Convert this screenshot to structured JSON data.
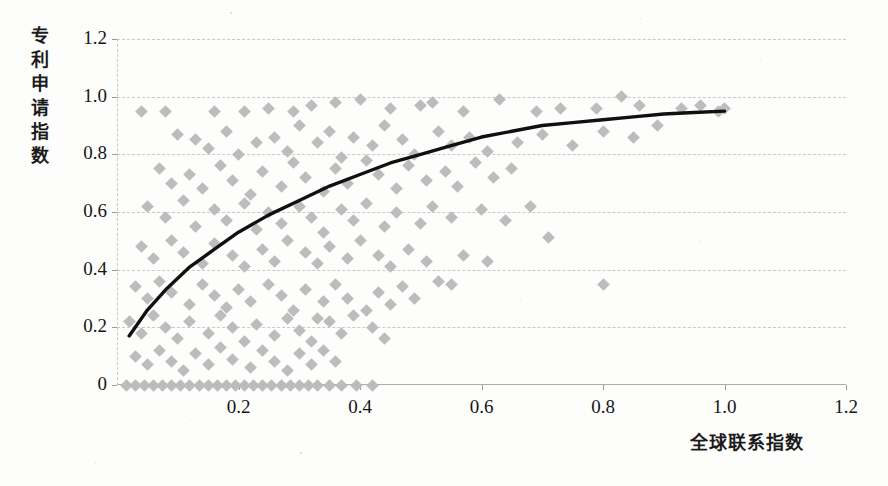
{
  "chart_data": {
    "type": "scatter",
    "title": "",
    "xlabel": "全球联系指数",
    "ylabel": "专利申请指数",
    "xlim": [
      0,
      1.2
    ],
    "ylim": [
      0,
      1.2
    ],
    "xticks": [
      "0.2",
      "0.4",
      "0.6",
      "0.8",
      "1.0",
      "1.2"
    ],
    "xtick_values": [
      0.2,
      0.4,
      0.6,
      0.8,
      1.0,
      1.2
    ],
    "yticks": [
      "0",
      "0.2",
      "0.4",
      "0.6",
      "0.8",
      "1.0",
      "1.2"
    ],
    "ytick_values": [
      0,
      0.2,
      0.4,
      0.6,
      0.8,
      1.0,
      1.2
    ],
    "grid": true,
    "legend": "none",
    "marker": "diamond",
    "marker_color": "#bcbcbc",
    "trendline_color": "#101010",
    "gridline_color": "#c9c9c9",
    "series": [
      {
        "name": "观测点",
        "type": "scatter",
        "points": [
          [
            0.04,
            0.95
          ],
          [
            0.08,
            0.95
          ],
          [
            0.16,
            0.95
          ],
          [
            0.21,
            0.95
          ],
          [
            0.25,
            0.96
          ],
          [
            0.29,
            0.95
          ],
          [
            0.32,
            0.97
          ],
          [
            0.36,
            0.98
          ],
          [
            0.4,
            0.99
          ],
          [
            0.45,
            0.96
          ],
          [
            0.5,
            0.97
          ],
          [
            0.52,
            0.98
          ],
          [
            0.57,
            0.95
          ],
          [
            0.63,
            0.99
          ],
          [
            0.69,
            0.95
          ],
          [
            0.73,
            0.96
          ],
          [
            0.79,
            0.96
          ],
          [
            0.83,
            1.0
          ],
          [
            0.86,
            0.97
          ],
          [
            0.93,
            0.96
          ],
          [
            0.96,
            0.97
          ],
          [
            0.99,
            0.95
          ],
          [
            1.0,
            0.96
          ],
          [
            0.1,
            0.87
          ],
          [
            0.13,
            0.85
          ],
          [
            0.15,
            0.82
          ],
          [
            0.18,
            0.88
          ],
          [
            0.2,
            0.8
          ],
          [
            0.23,
            0.84
          ],
          [
            0.26,
            0.86
          ],
          [
            0.28,
            0.81
          ],
          [
            0.3,
            0.9
          ],
          [
            0.33,
            0.84
          ],
          [
            0.35,
            0.88
          ],
          [
            0.37,
            0.79
          ],
          [
            0.39,
            0.86
          ],
          [
            0.42,
            0.83
          ],
          [
            0.44,
            0.9
          ],
          [
            0.47,
            0.85
          ],
          [
            0.49,
            0.8
          ],
          [
            0.53,
            0.88
          ],
          [
            0.55,
            0.83
          ],
          [
            0.58,
            0.86
          ],
          [
            0.61,
            0.81
          ],
          [
            0.66,
            0.84
          ],
          [
            0.7,
            0.87
          ],
          [
            0.75,
            0.83
          ],
          [
            0.8,
            0.88
          ],
          [
            0.85,
            0.86
          ],
          [
            0.89,
            0.9
          ],
          [
            0.07,
            0.75
          ],
          [
            0.09,
            0.7
          ],
          [
            0.12,
            0.73
          ],
          [
            0.14,
            0.68
          ],
          [
            0.17,
            0.76
          ],
          [
            0.19,
            0.71
          ],
          [
            0.22,
            0.66
          ],
          [
            0.24,
            0.74
          ],
          [
            0.27,
            0.69
          ],
          [
            0.29,
            0.77
          ],
          [
            0.31,
            0.72
          ],
          [
            0.34,
            0.67
          ],
          [
            0.36,
            0.75
          ],
          [
            0.38,
            0.7
          ],
          [
            0.41,
            0.78
          ],
          [
            0.43,
            0.73
          ],
          [
            0.46,
            0.68
          ],
          [
            0.48,
            0.76
          ],
          [
            0.51,
            0.71
          ],
          [
            0.54,
            0.74
          ],
          [
            0.56,
            0.69
          ],
          [
            0.59,
            0.77
          ],
          [
            0.62,
            0.72
          ],
          [
            0.65,
            0.75
          ],
          [
            0.68,
            0.62
          ],
          [
            0.71,
            0.51
          ],
          [
            0.05,
            0.62
          ],
          [
            0.08,
            0.58
          ],
          [
            0.11,
            0.64
          ],
          [
            0.13,
            0.55
          ],
          [
            0.16,
            0.61
          ],
          [
            0.18,
            0.57
          ],
          [
            0.21,
            0.63
          ],
          [
            0.23,
            0.54
          ],
          [
            0.25,
            0.6
          ],
          [
            0.27,
            0.56
          ],
          [
            0.3,
            0.62
          ],
          [
            0.32,
            0.58
          ],
          [
            0.34,
            0.53
          ],
          [
            0.37,
            0.61
          ],
          [
            0.39,
            0.57
          ],
          [
            0.41,
            0.63
          ],
          [
            0.44,
            0.55
          ],
          [
            0.46,
            0.6
          ],
          [
            0.5,
            0.56
          ],
          [
            0.52,
            0.62
          ],
          [
            0.55,
            0.58
          ],
          [
            0.6,
            0.61
          ],
          [
            0.64,
            0.57
          ],
          [
            0.04,
            0.48
          ],
          [
            0.06,
            0.44
          ],
          [
            0.09,
            0.5
          ],
          [
            0.11,
            0.46
          ],
          [
            0.14,
            0.42
          ],
          [
            0.16,
            0.49
          ],
          [
            0.19,
            0.45
          ],
          [
            0.21,
            0.41
          ],
          [
            0.24,
            0.47
          ],
          [
            0.26,
            0.43
          ],
          [
            0.28,
            0.5
          ],
          [
            0.31,
            0.46
          ],
          [
            0.33,
            0.42
          ],
          [
            0.35,
            0.48
          ],
          [
            0.38,
            0.44
          ],
          [
            0.4,
            0.5
          ],
          [
            0.43,
            0.45
          ],
          [
            0.45,
            0.41
          ],
          [
            0.48,
            0.47
          ],
          [
            0.51,
            0.43
          ],
          [
            0.57,
            0.45
          ],
          [
            0.61,
            0.43
          ],
          [
            0.53,
            0.36
          ],
          [
            0.55,
            0.35
          ],
          [
            0.8,
            0.35
          ],
          [
            0.03,
            0.34
          ],
          [
            0.05,
            0.3
          ],
          [
            0.07,
            0.36
          ],
          [
            0.09,
            0.32
          ],
          [
            0.12,
            0.28
          ],
          [
            0.14,
            0.35
          ],
          [
            0.16,
            0.31
          ],
          [
            0.18,
            0.27
          ],
          [
            0.2,
            0.33
          ],
          [
            0.22,
            0.29
          ],
          [
            0.25,
            0.35
          ],
          [
            0.27,
            0.31
          ],
          [
            0.29,
            0.26
          ],
          [
            0.31,
            0.33
          ],
          [
            0.34,
            0.29
          ],
          [
            0.36,
            0.35
          ],
          [
            0.38,
            0.3
          ],
          [
            0.41,
            0.26
          ],
          [
            0.43,
            0.32
          ],
          [
            0.45,
            0.28
          ],
          [
            0.47,
            0.34
          ],
          [
            0.49,
            0.3
          ],
          [
            0.02,
            0.22
          ],
          [
            0.04,
            0.18
          ],
          [
            0.06,
            0.24
          ],
          [
            0.08,
            0.2
          ],
          [
            0.1,
            0.16
          ],
          [
            0.12,
            0.22
          ],
          [
            0.15,
            0.18
          ],
          [
            0.17,
            0.24
          ],
          [
            0.19,
            0.2
          ],
          [
            0.21,
            0.15
          ],
          [
            0.23,
            0.21
          ],
          [
            0.26,
            0.17
          ],
          [
            0.28,
            0.23
          ],
          [
            0.3,
            0.19
          ],
          [
            0.32,
            0.15
          ],
          [
            0.35,
            0.22
          ],
          [
            0.37,
            0.18
          ],
          [
            0.39,
            0.24
          ],
          [
            0.42,
            0.2
          ],
          [
            0.44,
            0.16
          ],
          [
            0.33,
            0.23
          ],
          [
            0.03,
            0.1
          ],
          [
            0.05,
            0.07
          ],
          [
            0.07,
            0.12
          ],
          [
            0.09,
            0.08
          ],
          [
            0.11,
            0.05
          ],
          [
            0.13,
            0.11
          ],
          [
            0.15,
            0.07
          ],
          [
            0.17,
            0.13
          ],
          [
            0.19,
            0.09
          ],
          [
            0.22,
            0.06
          ],
          [
            0.24,
            0.12
          ],
          [
            0.26,
            0.08
          ],
          [
            0.28,
            0.05
          ],
          [
            0.3,
            0.11
          ],
          [
            0.32,
            0.07
          ],
          [
            0.34,
            0.12
          ],
          [
            0.36,
            0.08
          ],
          [
            0.015,
            0.0
          ],
          [
            0.03,
            0.0
          ],
          [
            0.045,
            0.0
          ],
          [
            0.06,
            0.0
          ],
          [
            0.075,
            0.0
          ],
          [
            0.09,
            0.0
          ],
          [
            0.105,
            0.0
          ],
          [
            0.12,
            0.0
          ],
          [
            0.135,
            0.0
          ],
          [
            0.15,
            0.0
          ],
          [
            0.165,
            0.0
          ],
          [
            0.18,
            0.0
          ],
          [
            0.195,
            0.0
          ],
          [
            0.21,
            0.0
          ],
          [
            0.225,
            0.0
          ],
          [
            0.24,
            0.0
          ],
          [
            0.255,
            0.0
          ],
          [
            0.27,
            0.0
          ],
          [
            0.285,
            0.0
          ],
          [
            0.3,
            0.0
          ],
          [
            0.315,
            0.0
          ],
          [
            0.33,
            0.0
          ],
          [
            0.35,
            0.0
          ],
          [
            0.37,
            0.0
          ],
          [
            0.395,
            0.0
          ],
          [
            0.42,
            0.0
          ]
        ]
      },
      {
        "name": "对数趋势线",
        "type": "line",
        "points": [
          [
            0.02,
            0.17
          ],
          [
            0.05,
            0.26
          ],
          [
            0.08,
            0.33
          ],
          [
            0.12,
            0.41
          ],
          [
            0.16,
            0.47
          ],
          [
            0.2,
            0.53
          ],
          [
            0.25,
            0.59
          ],
          [
            0.3,
            0.64
          ],
          [
            0.35,
            0.69
          ],
          [
            0.4,
            0.73
          ],
          [
            0.45,
            0.77
          ],
          [
            0.5,
            0.8
          ],
          [
            0.55,
            0.83
          ],
          [
            0.6,
            0.86
          ],
          [
            0.65,
            0.88
          ],
          [
            0.7,
            0.9
          ],
          [
            0.75,
            0.91
          ],
          [
            0.8,
            0.92
          ],
          [
            0.85,
            0.93
          ],
          [
            0.9,
            0.94
          ],
          [
            0.95,
            0.945
          ],
          [
            1.0,
            0.95
          ]
        ]
      }
    ]
  }
}
